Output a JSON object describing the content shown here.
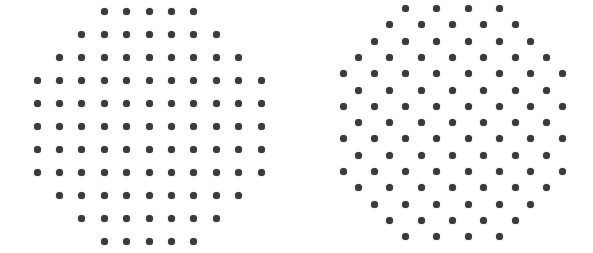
{
  "background": "#ffffff",
  "dot_color": "#3b3b3b",
  "dot_diameter": 7,
  "patterns": [
    {
      "name": "square-lattice-pattern",
      "lattice": "square",
      "origin_x": 37,
      "origin_y": 11,
      "pitch_x": 22.4,
      "pitch_y": 23,
      "rows": [
        {
          "start_col": 3,
          "count": 5
        },
        {
          "start_col": 2,
          "count": 7
        },
        {
          "start_col": 1,
          "count": 9
        },
        {
          "start_col": 0,
          "count": 11
        },
        {
          "start_col": 0,
          "count": 11
        },
        {
          "start_col": 0,
          "count": 11
        },
        {
          "start_col": 0,
          "count": 11
        },
        {
          "start_col": 0,
          "count": 11
        },
        {
          "start_col": 1,
          "count": 9
        },
        {
          "start_col": 2,
          "count": 7
        },
        {
          "start_col": 3,
          "count": 5
        }
      ]
    },
    {
      "name": "hexagonal-lattice-pattern",
      "lattice": "hexagonal",
      "origin_x": 343,
      "origin_y": 8.5,
      "pitch_x": 31.3,
      "pitch_y": 16.3,
      "rows": [
        {
          "start_half": 4,
          "count": 4
        },
        {
          "start_half": 3,
          "count": 5
        },
        {
          "start_half": 2,
          "count": 6
        },
        {
          "start_half": 1,
          "count": 7
        },
        {
          "start_half": 0,
          "count": 8
        },
        {
          "start_half": 1,
          "count": 7
        },
        {
          "start_half": 0,
          "count": 8
        },
        {
          "start_half": 1,
          "count": 7
        },
        {
          "start_half": 0,
          "count": 8
        },
        {
          "start_half": 1,
          "count": 7
        },
        {
          "start_half": 0,
          "count": 8
        },
        {
          "start_half": 1,
          "count": 7
        },
        {
          "start_half": 2,
          "count": 6
        },
        {
          "start_half": 3,
          "count": 5
        },
        {
          "start_half": 4,
          "count": 4
        }
      ]
    }
  ]
}
